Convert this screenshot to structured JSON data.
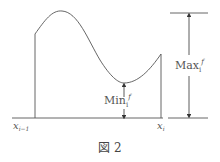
{
  "figure": {
    "caption": "図 2",
    "labels": {
      "x_left": "x",
      "x_left_sub": "i−1",
      "x_right": "x",
      "x_right_sub": "i",
      "min": "Min",
      "min_sub": "i",
      "min_sup": "f",
      "max": "Max",
      "max_sub": "i",
      "max_sup": "f"
    },
    "colors": {
      "line": "#555555",
      "text": "#555555",
      "background": "#ffffff"
    }
  }
}
